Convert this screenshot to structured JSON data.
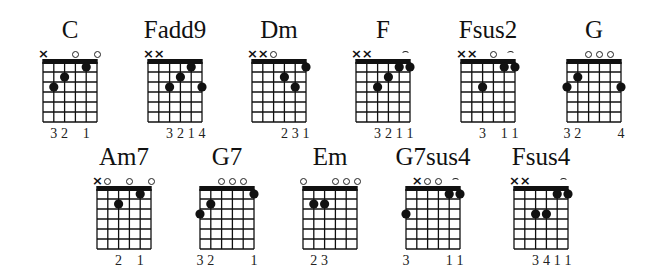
{
  "legend": {
    "open_string": "o",
    "muted_string": "x",
    "barre": "arc"
  },
  "colors": {
    "ink": "#111111",
    "background": "#ffffff"
  },
  "chords": [
    {
      "name": "C",
      "row": 0,
      "x": 43,
      "frets": [
        -1,
        3,
        2,
        0,
        1,
        0
      ],
      "fingers": [
        "",
        "3",
        "2",
        "",
        "1",
        ""
      ],
      "barre": null
    },
    {
      "name": "Fadd9",
      "row": 0,
      "x": 148,
      "frets": [
        -1,
        -1,
        3,
        2,
        1,
        3
      ],
      "fingers": [
        "",
        "",
        "3",
        "2",
        "1",
        "4"
      ],
      "barre": null
    },
    {
      "name": "Dm",
      "row": 0,
      "x": 252,
      "frets": [
        -1,
        -1,
        0,
        2,
        3,
        1
      ],
      "fingers": [
        "",
        "",
        "",
        "2",
        "3",
        "1"
      ],
      "barre": null
    },
    {
      "name": "F",
      "row": 0,
      "x": 356,
      "frets": [
        -1,
        -1,
        3,
        2,
        1,
        1
      ],
      "fingers": [
        "",
        "",
        "3",
        "2",
        "1",
        "1"
      ],
      "barre": [
        4,
        5
      ]
    },
    {
      "name": "Fsus2",
      "row": 0,
      "x": 461,
      "frets": [
        -1,
        -1,
        3,
        0,
        1,
        1
      ],
      "fingers": [
        "",
        "",
        "3",
        "",
        "1",
        "1"
      ],
      "barre": [
        4,
        5
      ]
    },
    {
      "name": "G",
      "row": 0,
      "x": 567,
      "frets": [
        3,
        2,
        0,
        0,
        0,
        3
      ],
      "fingers": [
        "3",
        "2",
        "",
        "",
        "",
        "4"
      ],
      "barre": null
    },
    {
      "name": "Am7",
      "row": 1,
      "x": 97,
      "frets": [
        -1,
        0,
        2,
        0,
        1,
        0
      ],
      "fingers": [
        "",
        "",
        "2",
        "",
        "1",
        ""
      ],
      "barre": null
    },
    {
      "name": "G7",
      "row": 1,
      "x": 200,
      "frets": [
        3,
        2,
        0,
        0,
        0,
        1
      ],
      "fingers": [
        "3",
        "2",
        "",
        "",
        "",
        "1"
      ],
      "barre": null
    },
    {
      "name": "Em",
      "row": 1,
      "x": 303,
      "frets": [
        0,
        2,
        2,
        0,
        0,
        0
      ],
      "fingers": [
        "",
        "2",
        "3",
        "",
        "",
        ""
      ],
      "barre": null
    },
    {
      "name": "G7sus4",
      "row": 1,
      "x": 406,
      "frets": [
        3,
        -1,
        0,
        0,
        1,
        1
      ],
      "fingers": [
        "3",
        "",
        "",
        "",
        "1",
        "1"
      ],
      "barre": [
        4,
        5
      ]
    },
    {
      "name": "Fsus4",
      "row": 1,
      "x": 514,
      "frets": [
        -1,
        -1,
        3,
        3,
        1,
        1
      ],
      "fingers": [
        "",
        "",
        "3",
        "4",
        "1",
        "1"
      ],
      "barre": [
        4,
        5
      ]
    }
  ]
}
